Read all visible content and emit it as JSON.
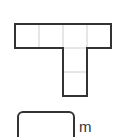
{
  "figure": {
    "shape": "T-tetromino-like grid figure",
    "top_row_cells": 4,
    "stem_cells": 2,
    "stem_column_index": 2,
    "outline_color": "#333333",
    "grid_color": "#cccccc"
  },
  "answer": {
    "value": "",
    "unit": "m"
  }
}
